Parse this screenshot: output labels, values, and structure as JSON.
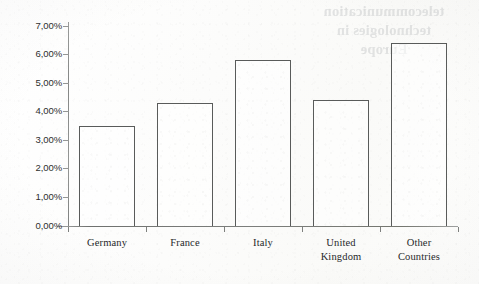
{
  "document": {
    "bleed_through_text": [
      "telecommunication",
      "technologies in",
      "Europe"
    ]
  },
  "chart_data": {
    "type": "bar",
    "title": "",
    "xlabel": "",
    "ylabel": "",
    "categories": [
      "Germany",
      "France",
      "Italy",
      "United Kingdom",
      "Other Countries"
    ],
    "category_lines": [
      [
        "Germany"
      ],
      [
        "France"
      ],
      [
        "Italy"
      ],
      [
        "United",
        "Kingdom"
      ],
      [
        "Other",
        "Countries"
      ]
    ],
    "values": [
      3.5,
      4.3,
      5.8,
      4.4,
      6.4
    ],
    "value_labels": [
      "3,50%",
      "4,30%",
      "5,80%",
      "4,40%",
      "6,40%"
    ],
    "ylim": [
      0,
      7
    ],
    "ytick_values": [
      0,
      1,
      2,
      3,
      4,
      5,
      6,
      7
    ],
    "ytick_labels": [
      "0,00%",
      "1,00%",
      "2,00%",
      "3,00%",
      "4,00%",
      "5,00%",
      "6,00%",
      "7,00%"
    ],
    "grid": false,
    "legend": null,
    "bar_fill": "#ffffff",
    "bar_edge_color": "#595b5a",
    "axis_color": "#7e807e",
    "decimal_separator": ","
  }
}
